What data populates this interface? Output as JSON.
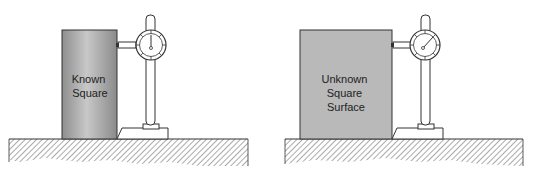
{
  "figures": [
    {
      "id": "left",
      "object": "cylinder",
      "label_lines": [
        "Known",
        "Square"
      ]
    },
    {
      "id": "right",
      "object": "block",
      "label_lines": [
        "Unknown",
        "Square",
        "Surface"
      ]
    }
  ],
  "colors": {
    "object_fill": "#b4b4b4",
    "object_dark": "#8a8a8a",
    "line": "#333333",
    "background": "#ffffff"
  }
}
